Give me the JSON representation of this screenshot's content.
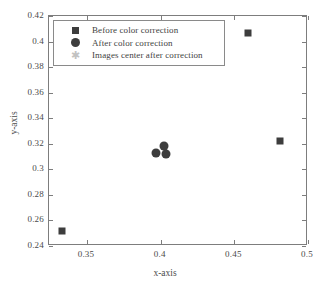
{
  "chart_data": {
    "type": "scatter",
    "title": "",
    "xlabel": "x-axis",
    "ylabel": "y-axis",
    "xlim": [
      0.3242,
      0.5
    ],
    "ylim": [
      0.24,
      0.42
    ],
    "xticks": [
      "0.35",
      "0.4",
      "0.45",
      "0.5"
    ],
    "xtick_values": [
      0.35,
      0.4,
      0.45,
      0.5
    ],
    "yticks": [
      "0.42",
      "0.4",
      "0.38",
      "0.36",
      "0.34",
      "0.32",
      "0.3",
      "0.28",
      "0.26",
      "0.24"
    ],
    "ytick_values": [
      0.42,
      0.4,
      0.38,
      0.36,
      0.34,
      0.32,
      0.3,
      0.28,
      0.26,
      0.24
    ],
    "grid": false,
    "legend_position": "upper left",
    "marker_color": "#3d3d3d",
    "star_color": "#bdbdbd",
    "frame_color": "#7d7d7d",
    "series": [
      {
        "name": "Before color correction",
        "marker": "square",
        "color": "#3d3d3d",
        "points": [
          {
            "x": 0.3329,
            "y": 0.2517
          },
          {
            "x": 0.4595,
            "y": 0.4067
          },
          {
            "x": 0.4813,
            "y": 0.3223
          }
        ]
      },
      {
        "name": "After color correction",
        "marker": "circle",
        "color": "#3d3d3d",
        "points": [
          {
            "x": 0.3965,
            "y": 0.3129
          },
          {
            "x": 0.4023,
            "y": 0.3184
          },
          {
            "x": 0.4038,
            "y": 0.3121
          }
        ]
      },
      {
        "name": "Images center after correction",
        "marker": "star",
        "color": "#bdbdbd",
        "points": []
      }
    ]
  },
  "legend": {
    "items": [
      {
        "label": "Before color correction",
        "marker": "square-marker"
      },
      {
        "label": "After color correction",
        "marker": "circle-marker"
      },
      {
        "label": "Images center after correction",
        "marker": "star-marker"
      }
    ]
  }
}
